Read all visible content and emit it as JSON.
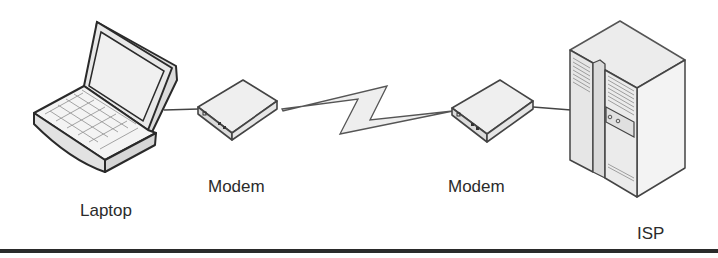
{
  "diagram": {
    "type": "network-connection",
    "nodes": [
      {
        "id": "laptop",
        "label": "Laptop",
        "icon": "laptop-icon"
      },
      {
        "id": "modem1",
        "label": "Modem",
        "icon": "modem-icon"
      },
      {
        "id": "modem2",
        "label": "Modem",
        "icon": "modem-icon"
      },
      {
        "id": "isp",
        "label": "ISP",
        "icon": "server-icon"
      }
    ],
    "edges": [
      {
        "from": "laptop",
        "to": "modem1",
        "style": "line"
      },
      {
        "from": "modem1",
        "to": "modem2",
        "style": "lightning-bolt"
      },
      {
        "from": "modem2",
        "to": "isp",
        "style": "line"
      }
    ]
  },
  "labels": {
    "laptop": "Laptop",
    "modem1": "Modem",
    "modem2": "Modem",
    "isp": "ISP"
  },
  "colors": {
    "stroke": "#2a2a2a",
    "fill_light": "#f2f2f2",
    "fill_mid": "#e4e4e4",
    "fill_dark": "#d2d2d2"
  }
}
